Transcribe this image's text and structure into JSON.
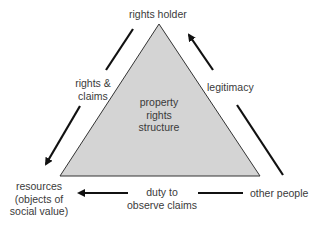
{
  "diagram": {
    "center_label": [
      "property",
      "rights",
      "structure"
    ],
    "nodes": {
      "top": "rights holder",
      "bottom_left": [
        "resources",
        "(objects of",
        "social value)"
      ],
      "bottom_right": "other people"
    },
    "edges": {
      "left": [
        "rights &",
        "claims"
      ],
      "right": "legitimacy",
      "bottom": [
        "duty to",
        "observe claims"
      ]
    },
    "colors": {
      "triangle_fill": "#d4d4d4",
      "triangle_stroke": "#333333",
      "arrow": "#111111",
      "text": "#3a3a3a"
    }
  }
}
